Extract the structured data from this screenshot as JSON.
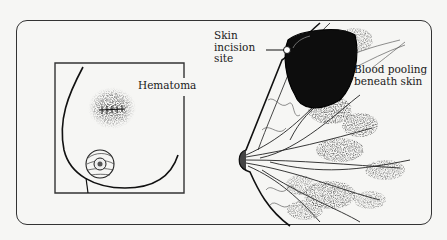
{
  "figure": {
    "type": "medical illustration",
    "panels": [
      {
        "id": "front-view",
        "description": "Front view of breast with stitched hematoma"
      },
      {
        "id": "side-view",
        "description": "Side cross-section of breast showing pooled blood"
      }
    ]
  },
  "labels": {
    "hematoma": "Hematoma",
    "skin_incision": [
      "Skin",
      "incision",
      "site"
    ],
    "blood_pooling": [
      "Blood pooling",
      "beneath skin"
    ]
  },
  "colors": {
    "background": "#f6f6f4",
    "ink": "#1a1a1a",
    "frame": "#333333"
  }
}
